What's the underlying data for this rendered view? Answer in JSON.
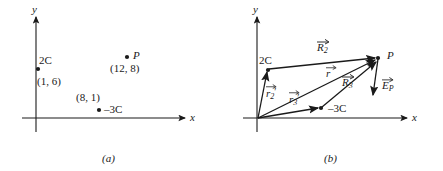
{
  "figure": {
    "panels": [
      {
        "caption": "(a)",
        "axis_x_label": "x",
        "axis_y_label": "y",
        "charges": [
          {
            "name": "charge-2c",
            "charge_label": "2C",
            "coord_label": "(1, 6)",
            "x": 1,
            "y": 6
          },
          {
            "name": "charge-minus-3c",
            "charge_label": "–3C",
            "coord_label": "(8, 1)",
            "x": 8,
            "y": 1
          }
        ],
        "field_point": {
          "name": "point-p",
          "label": "P",
          "coord_label": "(12, 8)",
          "x": 12,
          "y": 8
        }
      },
      {
        "caption": "(b)",
        "axis_x_label": "x",
        "axis_y_label": "y",
        "charges": [
          {
            "name": "charge-2c",
            "charge_label": "2C",
            "x": 1,
            "y": 6
          },
          {
            "name": "charge-minus-3c",
            "charge_label": "–3C",
            "x": 8,
            "y": 1
          }
        ],
        "field_point": {
          "name": "point-p",
          "label": "P",
          "x": 12,
          "y": 8
        },
        "vectors": [
          {
            "name": "vector-r2-prime",
            "symbol": "r",
            "subscript": "2",
            "prime": "′",
            "from": "origin",
            "to": "2C"
          },
          {
            "name": "vector-r3-prime",
            "symbol": "r",
            "subscript": "3",
            "prime": "′",
            "from": "origin",
            "to": "–3C"
          },
          {
            "name": "vector-r",
            "symbol": "r",
            "subscript": "",
            "prime": "",
            "from": "origin",
            "to": "P"
          },
          {
            "name": "vector-R2",
            "symbol": "R",
            "subscript": "2",
            "prime": "",
            "from": "2C",
            "to": "P"
          },
          {
            "name": "vector-R3",
            "symbol": "R",
            "subscript": "3",
            "prime": "",
            "from": "–3C",
            "to": "P"
          },
          {
            "name": "vector-EP",
            "symbol": "E",
            "subscript": "P",
            "prime": "",
            "from": "P",
            "to": "field direction"
          }
        ]
      }
    ]
  }
}
